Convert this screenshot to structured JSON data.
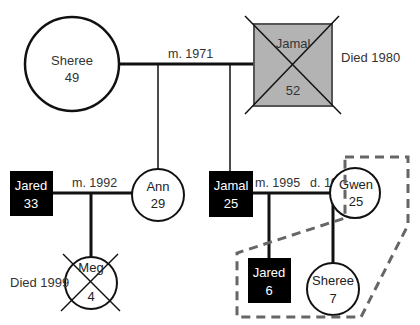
{
  "header": {
    "partial_text": "gen"
  },
  "colors": {
    "line": "#111111",
    "deceased_fill": "#b3b3b3",
    "male_fill": "#000000",
    "female_fill": "#ffffff",
    "dashed_boundary": "#666666"
  },
  "people": {
    "sheree_gen1": {
      "name": "Sheree",
      "age": "49",
      "sex": "female"
    },
    "jamal_gen1": {
      "name": "Jamal",
      "age": "52",
      "sex": "male",
      "deceased": true,
      "note": "Died 1980"
    },
    "jared_gen2": {
      "name": "Jared",
      "age": "33",
      "sex": "male"
    },
    "ann_gen2": {
      "name": "Ann",
      "age": "29",
      "sex": "female"
    },
    "jamal_gen2": {
      "name": "Jamal",
      "age": "25",
      "sex": "male"
    },
    "gwen_gen2": {
      "name": "Gwen",
      "age": "25",
      "sex": "female"
    },
    "meg_gen3": {
      "name": "Meg",
      "age": "4",
      "sex": "female",
      "deceased": true,
      "note": "Died 1999"
    },
    "jared_gen3": {
      "name": "Jared",
      "age": "6",
      "sex": "male"
    },
    "sheree_gen3": {
      "name": "Sheree",
      "age": "7",
      "sex": "female"
    }
  },
  "relationships": {
    "marriage_1": "m. 1971",
    "marriage_2": "m. 1992",
    "marriage_3": "m. 1995",
    "divorce_3": "d. 1997"
  }
}
